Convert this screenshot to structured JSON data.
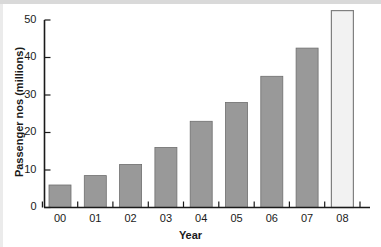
{
  "chart_data": {
    "type": "bar",
    "title": "",
    "xlabel": "Year",
    "ylabel": "Passenger nos (millions)",
    "categories": [
      "00",
      "01",
      "02",
      "03",
      "04",
      "05",
      "06",
      "07",
      "08"
    ],
    "values": [
      6,
      8.5,
      11.5,
      16,
      23,
      28,
      35,
      42.5,
      52.5
    ],
    "series": [
      {
        "name": "Passenger nos (millions)",
        "values": [
          6,
          8.5,
          11.5,
          16,
          23,
          28,
          35,
          42.5,
          52.5
        ]
      }
    ],
    "bar_styles": [
      "filled",
      "filled",
      "filled",
      "filled",
      "filled",
      "filled",
      "filled",
      "filled",
      "outlined"
    ],
    "ylim": [
      0,
      52.5
    ],
    "yticks": [
      0,
      10,
      20,
      30,
      40,
      50
    ],
    "ytick_labels": [
      "0",
      "10",
      "20",
      "30",
      "40",
      "50"
    ],
    "xtick_labels": [
      "00",
      "01",
      "02",
      "03",
      "04",
      "05",
      "06",
      "07",
      "08"
    ],
    "grid": false,
    "legend": null,
    "colors": {
      "bar_fill": "#999999",
      "bar_edge": "#6e6e6e",
      "highlight_fill": "#f2f2f2",
      "highlight_edge": "#808080",
      "axis": "#1a1a1a",
      "text": "#1a1a1a",
      "background": "#ffffff"
    }
  },
  "axes": {
    "y_axis_title": "Passenger nos (millions)",
    "x_axis_title": "Year",
    "y_tick_0": "0",
    "y_tick_10": "10",
    "y_tick_20": "20",
    "y_tick_30": "30",
    "y_tick_40": "40",
    "y_tick_50": "50",
    "x_tick_0": "00",
    "x_tick_1": "01",
    "x_tick_2": "02",
    "x_tick_3": "03",
    "x_tick_4": "04",
    "x_tick_5": "05",
    "x_tick_6": "06",
    "x_tick_7": "07",
    "x_tick_8": "08"
  }
}
